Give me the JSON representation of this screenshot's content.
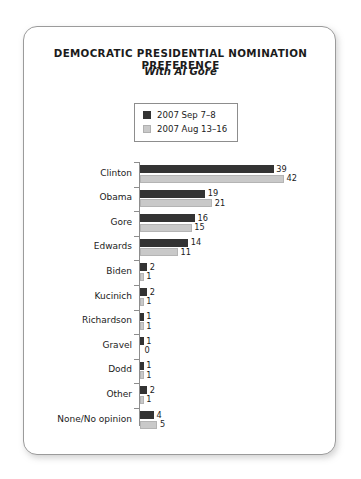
{
  "chart_data": {
    "type": "bar",
    "orientation": "horizontal",
    "title": "DEMOCRATIC PRESIDENTIAL NOMINATION PREFERENCE",
    "subtitle": "With Al Gore",
    "xlabel": "",
    "ylabel": "",
    "grid": false,
    "legend_position": "top-center",
    "xlim": [
      0,
      45
    ],
    "categories": [
      "Clinton",
      "Obama",
      "Gore",
      "Edwards",
      "Biden",
      "Kucinich",
      "Richardson",
      "Gravel",
      "Dodd",
      "Other",
      "None/No opinion"
    ],
    "series": [
      {
        "name": "2007 Sep 7–8",
        "color": "#333333",
        "values": [
          39,
          19,
          16,
          14,
          2,
          2,
          1,
          1,
          1,
          2,
          4
        ]
      },
      {
        "name": "2007 Aug 13–16",
        "color": "#c9c9c9",
        "values": [
          42,
          21,
          15,
          11,
          1,
          1,
          1,
          0,
          1,
          1,
          5
        ]
      }
    ]
  }
}
